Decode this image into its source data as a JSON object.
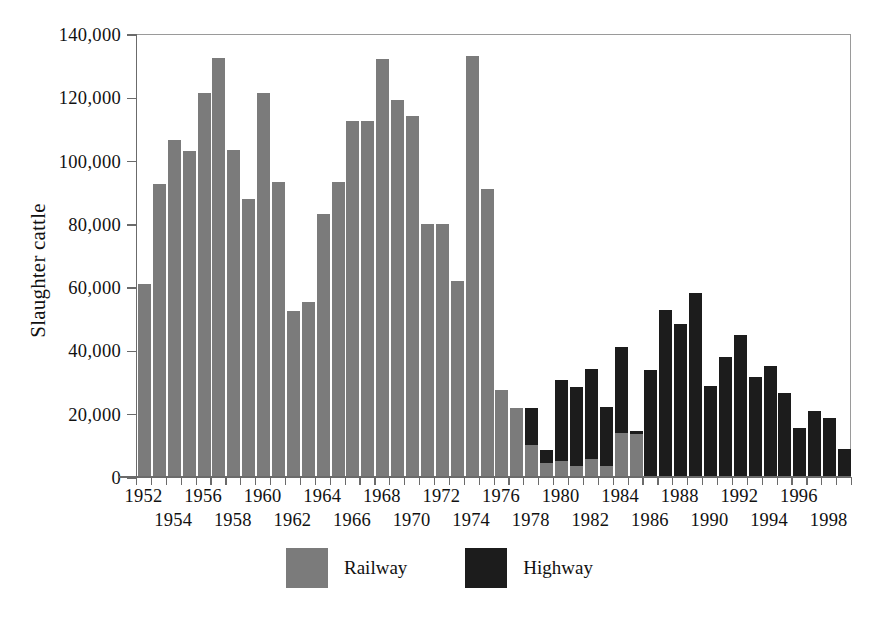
{
  "chart_data": {
    "type": "bar",
    "stacked": true,
    "title": "",
    "xlabel": "",
    "ylabel": "Slaughter cattle",
    "ylim": [
      0,
      140000
    ],
    "ytick_values": [
      0,
      20000,
      40000,
      60000,
      80000,
      100000,
      120000,
      140000
    ],
    "ytick_labels": [
      "0",
      "20,000",
      "40,000",
      "60,000",
      "80,000",
      "100,000",
      "120,000",
      "140,000"
    ],
    "grid": false,
    "legend_position": "bottom-center",
    "categories": [
      "1952",
      "1953",
      "1954",
      "1955",
      "1956",
      "1957",
      "1958",
      "1959",
      "1960",
      "1961",
      "1962",
      "1963",
      "1964",
      "1965",
      "1966",
      "1967",
      "1968",
      "1969",
      "1970",
      "1971",
      "1972",
      "1973",
      "1974",
      "1975",
      "1976",
      "1977",
      "1978",
      "1979",
      "1980",
      "1981",
      "1982",
      "1983",
      "1984",
      "1985",
      "1986",
      "1987",
      "1988",
      "1989",
      "1990",
      "1991",
      "1992",
      "1993",
      "1994",
      "1995",
      "1996",
      "1997",
      "1998",
      "1999"
    ],
    "xtick_labels_row_a": [
      "1952",
      "1956",
      "1960",
      "1964",
      "1968",
      "1972",
      "1976",
      "1980",
      "1984",
      "1988",
      "1992",
      "1996"
    ],
    "xtick_labels_row_b": [
      "1954",
      "1958",
      "1962",
      "1966",
      "1970",
      "1974",
      "1978",
      "1982",
      "1986",
      "1990",
      "1994",
      "1998"
    ],
    "series": [
      {
        "name": "Railway",
        "color": "#7b7b7b",
        "values": [
          61000,
          92500,
          106500,
          103000,
          121500,
          132300,
          103500,
          88000,
          121500,
          93200,
          52500,
          55200,
          83200,
          93200,
          112500,
          112500,
          132000,
          119200,
          114000,
          80000,
          80000,
          62000,
          133000,
          91000,
          27500,
          21800,
          10000,
          4500,
          5200,
          3600,
          5800,
          3400,
          14000,
          13500,
          0,
          0,
          0,
          0,
          0,
          0,
          0,
          0,
          0,
          0,
          0,
          0,
          0,
          0
        ]
      },
      {
        "name": "Highway",
        "color": "#1c1c1c",
        "values": [
          0,
          0,
          0,
          0,
          0,
          0,
          0,
          0,
          0,
          0,
          0,
          0,
          0,
          0,
          0,
          0,
          0,
          0,
          0,
          0,
          0,
          0,
          0,
          0,
          0,
          0,
          11800,
          4000,
          25500,
          25000,
          28200,
          18800,
          27000,
          1000,
          33800,
          52800,
          48200,
          58200,
          28800,
          38000,
          44800,
          31500,
          35200,
          26500,
          15500,
          21000,
          18500,
          9000
        ]
      }
    ],
    "totals": [
      61000,
      92500,
      106500,
      103000,
      121500,
      132300,
      103500,
      88000,
      121500,
      93200,
      52500,
      55200,
      83200,
      93200,
      112500,
      112500,
      132000,
      119200,
      114000,
      80000,
      80000,
      62000,
      133000,
      91000,
      27500,
      21800,
      21800,
      8500,
      30700,
      28600,
      34000,
      22200,
      41000,
      14500,
      33800,
      52800,
      48200,
      58200,
      28800,
      38000,
      44800,
      31500,
      35200,
      26500,
      15500,
      21000,
      18500,
      9000
    ]
  }
}
